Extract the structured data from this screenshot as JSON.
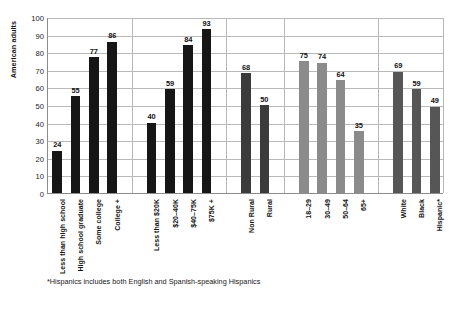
{
  "chart_data": {
    "type": "bar",
    "title": "",
    "subtitle": "",
    "xlabel": "",
    "ylabel": "American adults",
    "ylim": [
      0,
      100
    ],
    "ytick_step": 10,
    "ytick_labels": [
      "0",
      "10",
      "20",
      "30",
      "40",
      "50",
      "60",
      "70",
      "80",
      "90",
      "100"
    ],
    "grid": true,
    "legend": "none",
    "categories": [
      "Less than high school",
      "High school graduate",
      "Some college",
      "College +",
      "Less than $20K",
      "$20–40K",
      "$40–75K",
      "$75K +",
      "Non Rural",
      "Rural",
      "18–29",
      "30–49",
      "50–64",
      "65+",
      "White",
      "Black",
      "Hispanic*"
    ],
    "values": [
      24,
      55,
      77,
      86,
      40,
      59,
      84,
      93,
      68,
      50,
      75,
      74,
      64,
      35,
      69,
      59,
      49
    ],
    "groups": [
      {
        "name": "education",
        "color": "#161616",
        "indices": [
          0,
          1,
          2,
          3
        ]
      },
      {
        "name": "income",
        "color": "#161616",
        "indices": [
          4,
          5,
          6,
          7
        ]
      },
      {
        "name": "rurality",
        "color": "#3b3b3b",
        "indices": [
          8,
          9
        ]
      },
      {
        "name": "age",
        "color": "#8b8b8b",
        "indices": [
          10,
          11,
          12,
          13
        ]
      },
      {
        "name": "race-ethnicity",
        "color": "#565656",
        "indices": [
          14,
          15,
          16
        ]
      }
    ],
    "annotations": [
      "*Hispanics includes both English and Spanish-speaking Hispanics"
    ]
  },
  "footnote": "*Hispanics includes both English and Spanish-speaking Hispanics",
  "colors": {
    "axis": "#8c8c8c",
    "grid": "#b9b9b9",
    "text": "#141414",
    "background": "#ffffff"
  }
}
